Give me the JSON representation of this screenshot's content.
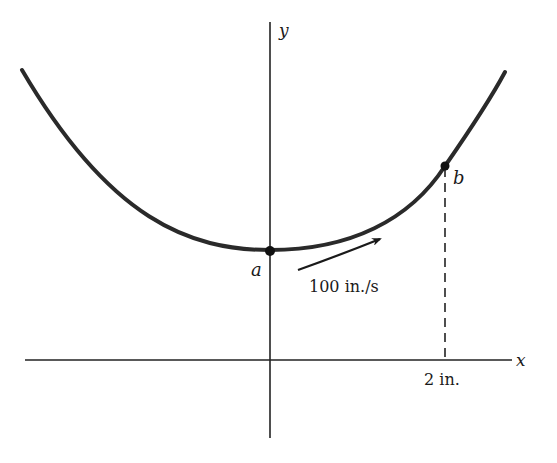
{
  "figure": {
    "axes": {
      "x_label": "x",
      "y_label": "y"
    },
    "curve": {
      "description": "U-shaped curve with minimum at point a on the y-axis",
      "color": "#2a2a2a"
    },
    "points": [
      {
        "name": "a",
        "label": "a"
      },
      {
        "name": "b",
        "label": "b"
      }
    ],
    "velocity": {
      "label": "100 in./s"
    },
    "dimension": {
      "label": "2 in."
    }
  }
}
